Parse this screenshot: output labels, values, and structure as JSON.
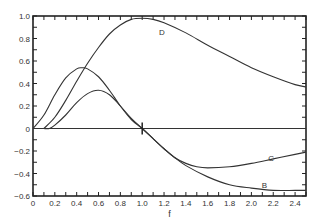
{
  "chart_data": {
    "type": "line",
    "title": "",
    "xlabel": "f",
    "ylabel": "",
    "xlim": [
      0,
      2.5
    ],
    "ylim": [
      -0.6,
      1.0
    ],
    "grid": false,
    "legend": "inline labels",
    "x_ticks": [
      "0",
      "0.2",
      "0.4",
      "0.6",
      "0.8",
      "1.0",
      "1.2",
      "1.4",
      "1.6",
      "1.8",
      "2.0",
      "2.2",
      "2.4"
    ],
    "y_ticks": [
      "1.0",
      "0.8",
      "0.6",
      "0.4",
      "0.2",
      "0",
      "−0.2",
      "−0.4",
      "−0.6"
    ],
    "annotations": [
      {
        "text": "D",
        "x": 1.18,
        "y": 0.83
      },
      {
        "text": "C",
        "x": 2.18,
        "y": -0.29
      },
      {
        "text": "B",
        "x": 2.12,
        "y": -0.53
      },
      {
        "text": "|",
        "x": 1.0,
        "y": 0.0,
        "note": "tick marker at f=1.0 on zero line"
      }
    ],
    "series": [
      {
        "name": "D",
        "x": [
          0.1,
          0.2,
          0.3,
          0.4,
          0.5,
          0.6,
          0.7,
          0.8,
          0.9,
          1.0,
          1.1,
          1.2,
          1.4,
          1.6,
          1.8,
          2.0,
          2.2,
          2.4,
          2.5
        ],
        "y": [
          0.0,
          0.1,
          0.25,
          0.42,
          0.58,
          0.72,
          0.84,
          0.92,
          0.97,
          0.98,
          0.97,
          0.94,
          0.85,
          0.74,
          0.64,
          0.54,
          0.46,
          0.39,
          0.37
        ]
      },
      {
        "name": "A/B",
        "x": [
          0.0,
          0.1,
          0.2,
          0.3,
          0.4,
          0.45,
          0.5,
          0.6,
          0.7,
          0.8,
          0.9,
          1.0,
          1.1,
          1.2,
          1.3,
          1.4,
          1.6,
          1.8,
          2.0,
          2.2,
          2.4,
          2.5
        ],
        "y": [
          0.0,
          0.12,
          0.3,
          0.45,
          0.53,
          0.54,
          0.53,
          0.46,
          0.34,
          0.2,
          0.08,
          0.0,
          -0.09,
          -0.18,
          -0.26,
          -0.33,
          -0.43,
          -0.5,
          -0.53,
          -0.55,
          -0.55,
          -0.55
        ]
      },
      {
        "name": "C",
        "x": [
          0.1,
          0.15,
          0.2,
          0.3,
          0.4,
          0.5,
          0.6,
          0.7,
          0.8,
          0.9,
          1.0,
          1.1,
          1.2,
          1.3,
          1.4,
          1.5,
          1.6,
          1.8,
          2.0,
          2.2,
          2.4,
          2.5
        ],
        "y": [
          0.0,
          0.0,
          0.03,
          0.12,
          0.23,
          0.31,
          0.34,
          0.3,
          0.2,
          0.09,
          0.0,
          -0.09,
          -0.18,
          -0.26,
          -0.31,
          -0.34,
          -0.35,
          -0.34,
          -0.31,
          -0.27,
          -0.23,
          -0.21
        ]
      }
    ]
  }
}
